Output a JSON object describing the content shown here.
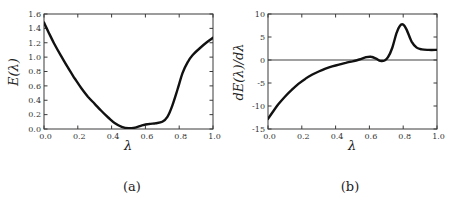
{
  "figure": {
    "background": "#ffffff",
    "frame_color": "#3a3a3a",
    "tick_label_color": "#333333"
  },
  "chart_data": [
    {
      "type": "line",
      "panel": "a",
      "caption": "(a)",
      "title": "",
      "xlabel": "λ",
      "ylabel": "E(λ)",
      "xlim": [
        0,
        1.0
      ],
      "ylim": [
        0,
        1.6
      ],
      "grid": false,
      "legend": "none",
      "xticks": [
        0,
        0.2,
        0.4,
        0.6,
        0.8,
        1.0
      ],
      "xtick_labels": [
        "0.0",
        "0.2",
        "0.4",
        "0.6",
        "0.8",
        "1.0"
      ],
      "yticks": [
        0,
        0.2,
        0.4,
        0.6,
        0.8,
        1.0,
        1.2,
        1.4,
        1.6
      ],
      "ytick_labels": [
        "0.0",
        "0.2",
        "0.4",
        "0.6",
        "0.8",
        "1.0",
        "1.2",
        "1.4",
        "1.6"
      ],
      "line_color": "#111111",
      "line_width": 2.4,
      "series": [
        {
          "name": "E(lambda)",
          "x": [
            0.0,
            0.03,
            0.06,
            0.1,
            0.14,
            0.18,
            0.22,
            0.26,
            0.3,
            0.34,
            0.38,
            0.42,
            0.46,
            0.5,
            0.54,
            0.58,
            0.62,
            0.66,
            0.7,
            0.73,
            0.76,
            0.79,
            0.82,
            0.85,
            0.88,
            0.92,
            0.96,
            1.0
          ],
          "y": [
            1.48,
            1.33,
            1.19,
            1.02,
            0.86,
            0.71,
            0.57,
            0.45,
            0.35,
            0.25,
            0.16,
            0.08,
            0.03,
            0.01,
            0.02,
            0.05,
            0.07,
            0.08,
            0.1,
            0.17,
            0.33,
            0.55,
            0.78,
            0.93,
            1.03,
            1.12,
            1.2,
            1.27
          ]
        }
      ]
    },
    {
      "type": "line",
      "panel": "b",
      "caption": "(b)",
      "title": "",
      "xlabel": "λ",
      "ylabel": "dE(λ)/dλ",
      "xlim": [
        0,
        1.0
      ],
      "ylim": [
        -15,
        10
      ],
      "grid": false,
      "legend": "none",
      "xticks": [
        0,
        0.2,
        0.4,
        0.6,
        0.8,
        1.0
      ],
      "xtick_labels": [
        "0.0",
        "0.2",
        "0.4",
        "0.6",
        "0.8",
        "1.0"
      ],
      "yticks": [
        -15,
        -10,
        -5,
        0,
        5,
        10
      ],
      "ytick_labels": [
        "-15",
        "-10",
        "-5",
        "0",
        "5",
        "10"
      ],
      "line_color": "#111111",
      "line_width": 2.4,
      "reflines": [
        {
          "y": 0,
          "color": "#808080",
          "width": 1.4
        }
      ],
      "series": [
        {
          "name": "dE/dlambda",
          "x": [
            0.0,
            0.03,
            0.06,
            0.1,
            0.14,
            0.18,
            0.22,
            0.26,
            0.3,
            0.34,
            0.38,
            0.42,
            0.46,
            0.5,
            0.54,
            0.58,
            0.61,
            0.64,
            0.665,
            0.69,
            0.71,
            0.735,
            0.76,
            0.78,
            0.8,
            0.82,
            0.85,
            0.88,
            0.91,
            0.95,
            1.0
          ],
          "y": [
            -12.8,
            -11.2,
            -9.7,
            -8.0,
            -6.5,
            -5.2,
            -4.1,
            -3.2,
            -2.5,
            -1.9,
            -1.4,
            -1.0,
            -0.6,
            -0.3,
            0.1,
            0.6,
            0.7,
            0.3,
            -0.2,
            -0.1,
            0.6,
            2.6,
            5.8,
            7.4,
            7.7,
            6.6,
            4.0,
            2.7,
            2.3,
            2.2,
            2.2
          ]
        }
      ]
    }
  ]
}
